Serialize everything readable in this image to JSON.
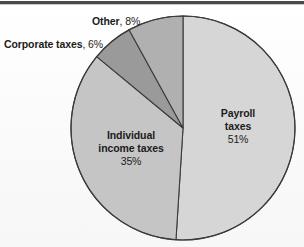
{
  "figure": {
    "width": 304,
    "height": 247,
    "background": "#fdfdfd",
    "has_top_rule": true,
    "top_rule_color": "#4a4a4a"
  },
  "chart_data": {
    "type": "pie",
    "title": "",
    "subtitle": "",
    "xlabel": "",
    "ylabel": "",
    "legend": "none",
    "grid": false,
    "start_angle_deg": 0,
    "direction": "clockwise",
    "center": {
      "x": 183,
      "y": 128
    },
    "radius": 112,
    "categories": [
      "Payroll taxes",
      "Individual income taxes",
      "Corporate taxes",
      "Other"
    ],
    "values": [
      51,
      35,
      6,
      8
    ],
    "value_unit": "%",
    "slice_colors": [
      "#d6d6d6",
      "#c5c5c5",
      "#9a9a9a",
      "#b0b0b0"
    ],
    "slice_border_color": "#3b3b3b",
    "slices": [
      {
        "name": "Payroll taxes",
        "value": 51,
        "value_label": "51%",
        "color": "#d6d6d6",
        "label_placement": "inside",
        "start_angle_deg": 0,
        "end_angle_deg": 183.6
      },
      {
        "name": "Individual income taxes",
        "value": 35,
        "value_label": "35%",
        "color": "#c5c5c5",
        "label_placement": "inside",
        "start_angle_deg": 183.6,
        "end_angle_deg": 309.6
      },
      {
        "name": "Corporate taxes",
        "value": 6,
        "value_label": "6%",
        "color": "#9a9a9a",
        "label_placement": "outside-left",
        "start_angle_deg": 309.6,
        "end_angle_deg": 331.2
      },
      {
        "name": "Other",
        "value": 8,
        "value_label": "8%",
        "color": "#b0b0b0",
        "label_placement": "outside-top",
        "start_angle_deg": 331.2,
        "end_angle_deg": 360
      }
    ]
  },
  "labels": {
    "other": {
      "name": "Other",
      "value": ", 8%"
    },
    "corporate": {
      "name": "Corporate taxes",
      "value": ", 6%"
    },
    "payroll": {
      "name_line1": "Payroll",
      "name_line2": "taxes",
      "value": "51%"
    },
    "individual": {
      "name_line1": "Individual",
      "name_line2": "income taxes",
      "value": "35%"
    }
  }
}
